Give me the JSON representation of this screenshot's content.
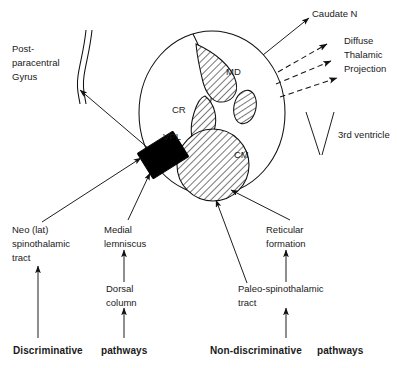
{
  "diagram": {
    "structures": [
      {
        "key": "vpl",
        "label": "VPL",
        "kind": "solid-black-block",
        "description": "ventral posterolateral nucleus"
      },
      {
        "key": "cr",
        "label": "CR",
        "kind": "hatched-lens",
        "description": "central region / internal medullary lamina"
      },
      {
        "key": "md",
        "label": "MD",
        "kind": "hatched-crescent",
        "description": "medial dorsal nucleus"
      },
      {
        "key": "cm",
        "label": "CM",
        "kind": "hatched-circle",
        "description": "centromedian nucleus"
      },
      {
        "key": "small-nucleus",
        "label": "",
        "kind": "hatched-ellipse",
        "description": "small unlabeled hatched nucleus"
      }
    ],
    "cortex": {
      "label_line1": "Post-",
      "label_line2": "paracentral",
      "label_line3": "Gyrus"
    },
    "projections": {
      "caudate": "Caudate N",
      "diffuse_line1": "Diffuse",
      "diffuse_line2": "Thalamic",
      "diffuse_line3": "Projection",
      "ventricle": "3rd ventricle"
    },
    "inputs": {
      "neo_line1": "Neo (lat)",
      "neo_line2": "spinothalamic",
      "neo_line3": "tract",
      "lemniscus_line1": "Medial",
      "lemniscus_line2": "lemniscus",
      "dorsal_line1": "Dorsal",
      "dorsal_line2": "column",
      "reticular_line1": "Reticular",
      "reticular_line2": "formation",
      "paleo_line1": "Paleo-spinothalamic",
      "paleo_line2": "tract"
    },
    "footers": {
      "discriminative_bold": "Discriminative",
      "discriminative_rest": "pathways",
      "nondiscriminative_bold": "Non-discriminative",
      "nondiscriminative_rest": "pathways"
    },
    "colors": {
      "ink": "#111111",
      "background": "#ffffff",
      "fill_black": "#000000"
    }
  }
}
